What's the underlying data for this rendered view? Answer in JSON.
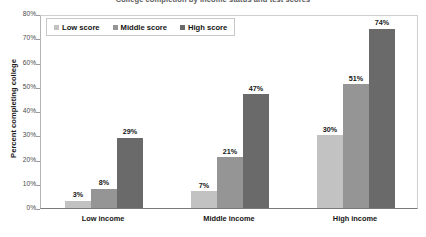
{
  "chart_data": {
    "type": "bar",
    "title": "College completion by income status and test scores",
    "xlabel": "",
    "ylabel": "Percent completing college",
    "ylim": [
      0,
      80
    ],
    "yticks": [
      "0%",
      "10%",
      "20%",
      "30%",
      "40%",
      "50%",
      "60%",
      "70%",
      "80%"
    ],
    "ytick_values": [
      0,
      10,
      20,
      30,
      40,
      50,
      60,
      70,
      80
    ],
    "grid": false,
    "legend_position": "top-left",
    "categories": [
      "Low income",
      "Middle income",
      "High income"
    ],
    "series": [
      {
        "name": "Low score",
        "values": [
          3,
          7,
          30
        ],
        "labels": [
          "3%",
          "7%",
          "30%"
        ],
        "color": "#c2c2c2"
      },
      {
        "name": "Middle score",
        "values": [
          8,
          21,
          51
        ],
        "labels": [
          "8%",
          "21%",
          "51%"
        ],
        "color": "#959595"
      },
      {
        "name": "High score",
        "values": [
          29,
          47,
          74
        ],
        "labels": [
          "29%",
          "47%",
          "74%"
        ],
        "color": "#6a6a6a"
      }
    ]
  },
  "legend": {
    "items": [
      {
        "label": "Low score"
      },
      {
        "label": "Middle score"
      },
      {
        "label": "High score"
      }
    ]
  }
}
